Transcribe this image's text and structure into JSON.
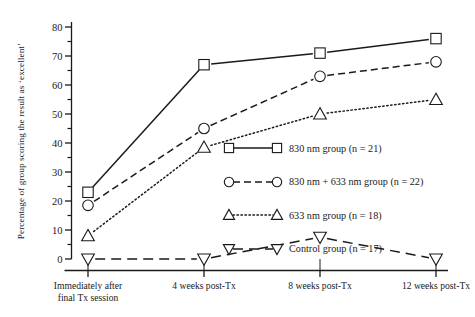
{
  "chart_data": {
    "type": "line",
    "title": "",
    "xlabel": "",
    "ylabel": "Percentage of group scoring the result as ‘excellent’",
    "categories": [
      "Immediately after final Tx session",
      "4 weeks post-Tx",
      "8 weeks post-Tx",
      "12 weeks post-Tx"
    ],
    "xtick_labels": [
      [
        "Immediately after",
        "final Tx session"
      ],
      [
        "4 weeks post-Tx"
      ],
      [
        "8 weeks post-Tx"
      ],
      [
        "12 weeks post-Tx"
      ]
    ],
    "ylim": [
      0,
      80
    ],
    "ytick_values": [
      0,
      10,
      20,
      30,
      40,
      50,
      60,
      70,
      80
    ],
    "ytick_labels": [
      "0",
      "10",
      "20",
      "30",
      "40",
      "50",
      "60",
      "70",
      "80"
    ],
    "yminor_values": [
      5,
      15,
      25,
      35,
      45,
      55,
      65,
      75
    ],
    "grid": false,
    "legend_position": "center-right",
    "series": [
      {
        "name": "830 nm group (n = 21)",
        "marker": "square",
        "linestyle": "solid",
        "color": "#1a1a1a",
        "values": [
          23,
          67,
          71,
          76
        ]
      },
      {
        "name": "830 nm + 633 nm group (n = 22)",
        "marker": "circle",
        "linestyle": "dashed",
        "color": "#1a1a1a",
        "values": [
          18.5,
          45,
          63,
          68
        ]
      },
      {
        "name": "633 nm group (n = 18)",
        "marker": "triangle-up",
        "linestyle": "dotted",
        "color": "#1a1a1a",
        "values": [
          8,
          38.5,
          50,
          55
        ]
      },
      {
        "name": "Control group (n = 17)",
        "marker": "triangle-down",
        "linestyle": "long-dashed",
        "color": "#1a1a1a",
        "values": [
          0,
          0,
          7.5,
          0
        ]
      }
    ]
  },
  "legend": {
    "items": [
      {
        "label": "830 nm group (n = 21)",
        "marker": "square",
        "linestyle": "solid"
      },
      {
        "label": "830 nm + 633 nm group (n = 22)",
        "marker": "circle",
        "linestyle": "dashed"
      },
      {
        "label": "633 nm group (n = 18)",
        "marker": "triangle-up",
        "linestyle": "dotted"
      },
      {
        "label": "Control group (n = 17)",
        "marker": "triangle-down",
        "linestyle": "long-dashed"
      }
    ]
  },
  "axes": {
    "y_axis_title": "Percentage of group scoring the result as ‘excellent’"
  },
  "colors": {
    "ink": "#1a1a1a",
    "background": "#ffffff"
  }
}
